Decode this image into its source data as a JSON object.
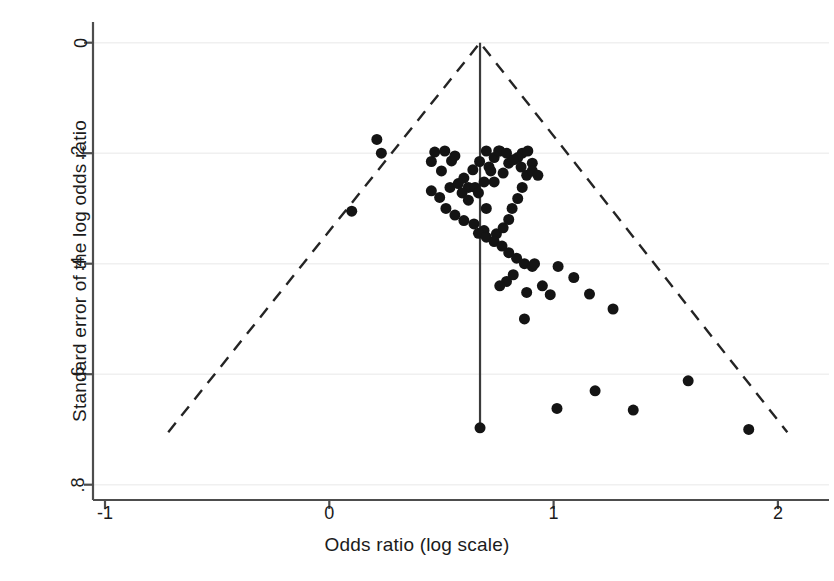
{
  "chart_data": {
    "type": "scatter",
    "title": "",
    "subtitle": "",
    "xlabel": "Odds ratio (log scale)",
    "ylabel": "Standard error of the log odds ratio",
    "xlim": [
      -1.3,
      2.1
    ],
    "ylim": [
      0.82,
      -0.04
    ],
    "xticks": [
      -1,
      0,
      1,
      2
    ],
    "xticklabels": [
      "-1",
      "0",
      "1",
      "2"
    ],
    "yticks": [
      0,
      0.2,
      0.4,
      0.6,
      0.8
    ],
    "yticklabels": [
      "0",
      ".2",
      ".4",
      ".6",
      ".8"
    ],
    "grid": "horizontal-light",
    "legend": "none",
    "marker": {
      "shape": "circle",
      "color": "#141414",
      "size": 11
    },
    "pooled_effect_line": {
      "x": 0.672,
      "y_from": 0,
      "y_to": 0.697,
      "style": "solid",
      "color": "#3b3b3b"
    },
    "funnel_bounds": {
      "style": "dashed",
      "color": "#242424",
      "apex": {
        "x": 0.672,
        "y": 0
      },
      "left_base": {
        "x": -0.718,
        "y": 0.705
      },
      "right_base": {
        "x": 2.042,
        "y": 0.705
      },
      "ci_multiplier": 1.96
    },
    "x": [
      0.1,
      0.232,
      0.212,
      0.455,
      0.47,
      0.515,
      0.5,
      0.545,
      0.56,
      0.6,
      0.62,
      0.455,
      0.492,
      0.538,
      0.575,
      0.592,
      0.62,
      0.65,
      0.64,
      0.67,
      0.52,
      0.56,
      0.6,
      0.645,
      0.7,
      0.665,
      0.69,
      0.712,
      0.735,
      0.76,
      0.72,
      0.69,
      0.745,
      0.775,
      0.8,
      0.815,
      0.84,
      0.86,
      0.88,
      0.905,
      0.86,
      0.885,
      0.84,
      0.8,
      0.775,
      0.735,
      0.7,
      0.755,
      0.79,
      0.82,
      0.855,
      0.905,
      0.93,
      0.665,
      0.7,
      0.735,
      0.77,
      0.8,
      0.835,
      0.87,
      0.905,
      0.82,
      0.79,
      0.76,
      0.88,
      0.915,
      0.95,
      0.985,
      1.02,
      1.09,
      1.16,
      1.265,
      0.672,
      0.87,
      1.015,
      1.185,
      1.355,
      1.6,
      1.87
    ],
    "y": [
      0.305,
      0.2,
      0.175,
      0.215,
      0.198,
      0.196,
      0.232,
      0.214,
      0.205,
      0.245,
      0.262,
      0.268,
      0.28,
      0.262,
      0.255,
      0.272,
      0.285,
      0.262,
      0.23,
      0.215,
      0.3,
      0.312,
      0.322,
      0.328,
      0.3,
      0.272,
      0.252,
      0.225,
      0.208,
      0.196,
      0.232,
      0.34,
      0.346,
      0.335,
      0.32,
      0.3,
      0.282,
      0.262,
      0.24,
      0.218,
      0.2,
      0.196,
      0.208,
      0.218,
      0.236,
      0.252,
      0.196,
      0.196,
      0.2,
      0.212,
      0.225,
      0.232,
      0.24,
      0.345,
      0.352,
      0.36,
      0.368,
      0.38,
      0.39,
      0.4,
      0.405,
      0.42,
      0.432,
      0.44,
      0.452,
      0.4,
      0.44,
      0.456,
      0.405,
      0.425,
      0.455,
      0.482,
      0.697,
      0.5,
      0.662,
      0.63,
      0.665,
      0.612,
      0.7
    ],
    "n_points": 79
  },
  "axes": {
    "x_title": "Odds ratio (log scale)",
    "y_title": "Standard error of the log odds ratio",
    "x_tick_labels": [
      "-1",
      "0",
      "1",
      "2"
    ],
    "y_tick_labels": [
      "0",
      ".2",
      ".4",
      ".6",
      ".8"
    ]
  },
  "style": {
    "background": "#ffffff",
    "axis_color": "#4d4d4d",
    "grid_color": "#f0f0f0",
    "marker_color": "#141414",
    "funnel_color": "#242424"
  }
}
